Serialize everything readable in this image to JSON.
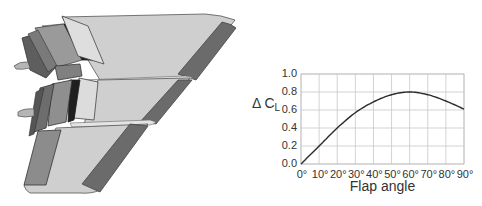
{
  "figure": {
    "illustration": {
      "subject": "swept wing with deployed trailing-edge flaps (three spanwise sections) and leading-edge flaps"
    },
    "ylabel_main": "Δ C",
    "ylabel_sub": "L",
    "xlabel": "Flap angle"
  },
  "chart_data": {
    "type": "line",
    "title": "",
    "xlabel": "Flap angle",
    "ylabel": "Δ CL",
    "x": [
      0,
      10,
      20,
      30,
      40,
      50,
      60,
      70,
      80,
      90
    ],
    "x_tick_labels": [
      "0°",
      "10°",
      "20°",
      "30°",
      "40°",
      "50°",
      "60°",
      "70°",
      "80°",
      "90°"
    ],
    "y_tick_labels": [
      "0.0",
      "0.2",
      "0.4",
      "0.6",
      "0.8",
      "1.0"
    ],
    "series": [
      {
        "name": "Δ CL",
        "values": [
          0.0,
          0.2,
          0.4,
          0.57,
          0.69,
          0.77,
          0.8,
          0.77,
          0.7,
          0.61
        ]
      }
    ],
    "xlim": [
      0,
      90
    ],
    "ylim": [
      0.0,
      1.0
    ],
    "grid": true,
    "legend": "none",
    "colors": {
      "line": "#2b2b2b",
      "grid": "#c8c8c8",
      "frame": "#bdbdbd"
    }
  }
}
